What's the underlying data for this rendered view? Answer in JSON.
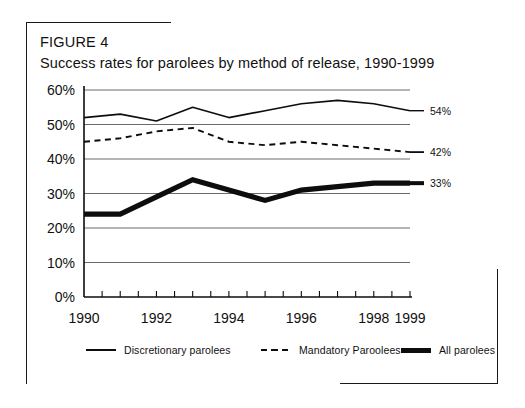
{
  "figure": {
    "label": "FIGURE 4",
    "title": "Success rates for parolees by method of release, 1990-1999"
  },
  "legend": {
    "items": [
      {
        "name": "discretionary",
        "label": "Discretionary parolees",
        "style": "solid-thin"
      },
      {
        "name": "mandatory",
        "label": "Mandatory Paroolees",
        "style": "dashed"
      },
      {
        "name": "all",
        "label": "All parolees",
        "style": "solid-thick"
      }
    ]
  },
  "chart_data": {
    "type": "line",
    "title": "Success rates for parolees by method of release, 1990-1999",
    "xlabel": "",
    "ylabel": "",
    "xlim": [
      1990,
      1999
    ],
    "ylim": [
      0,
      60
    ],
    "grid": true,
    "legend_position": "bottom",
    "x": [
      1990,
      1991,
      1992,
      1993,
      1994,
      1995,
      1996,
      1997,
      1998,
      1999
    ],
    "xtick_labels": [
      "1990",
      "1992",
      "1994",
      "1996",
      "1998",
      "1999"
    ],
    "xtick_values": [
      1990,
      1992,
      1994,
      1996,
      1998,
      1999
    ],
    "ytick_labels": [
      "0%",
      "10%",
      "20%",
      "30%",
      "40%",
      "50%",
      "60%"
    ],
    "ytick_values": [
      0,
      10,
      20,
      30,
      40,
      50,
      60
    ],
    "series": [
      {
        "name": "Discretionary parolees",
        "style": "solid-thin",
        "values": [
          52,
          53,
          51,
          55,
          52,
          54,
          56,
          57,
          56,
          54
        ],
        "end_label": "54%"
      },
      {
        "name": "Mandatory Paroolees",
        "style": "dashed",
        "values": [
          45,
          46,
          48,
          49,
          45,
          44,
          45,
          44,
          43,
          42
        ],
        "end_label": "42%"
      },
      {
        "name": "All parolees",
        "style": "solid-thick",
        "values": [
          24,
          24,
          29,
          34,
          31,
          28,
          31,
          32,
          33,
          33
        ],
        "end_label": "33%"
      }
    ]
  }
}
